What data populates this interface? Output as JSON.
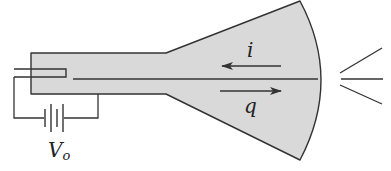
{
  "diagram": {
    "type": "cathode ray tube schematic",
    "labels": {
      "current": "i",
      "charge": "q",
      "voltage_main": "V",
      "voltage_sub": "o"
    },
    "arrows": [
      {
        "label": "i",
        "direction": "left"
      },
      {
        "label": "q",
        "direction": "right"
      }
    ],
    "colors": {
      "tube_fill": "#d9d9d9",
      "stroke": "#333333",
      "background": "#ffffff"
    }
  }
}
